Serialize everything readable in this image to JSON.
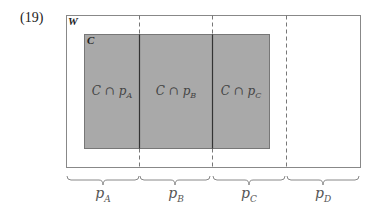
{
  "example_number": "(19)",
  "outer_set": {
    "label": "W"
  },
  "inner_set": {
    "label": "C",
    "fill": "#a9a9a9"
  },
  "regions": [
    {
      "label": "C ∩ p",
      "sub": "A"
    },
    {
      "label": "C ∩ p",
      "sub": "B"
    },
    {
      "label": "C ∩ p",
      "sub": "C"
    }
  ],
  "partitions": [
    {
      "label": "p",
      "sub": "A"
    },
    {
      "label": "p",
      "sub": "B"
    },
    {
      "label": "p",
      "sub": "C"
    },
    {
      "label": "p",
      "sub": "D"
    }
  ]
}
